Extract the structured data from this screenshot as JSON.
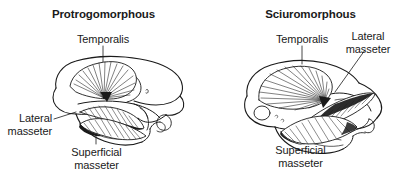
{
  "figure": {
    "type": "anatomical-illustration",
    "background_color": "#ffffff",
    "ink_color": "#1a1a1a"
  },
  "panels": [
    {
      "id": "protrogomorphous",
      "title": "Protrogomorphous",
      "labels": {
        "temporalis": "Temporalis",
        "lateral_masseter_line1": "Lateral",
        "lateral_masseter_line2": "masseter",
        "superficial_masseter_line1": "Superficial",
        "superficial_masseter_line2": "masseter"
      }
    },
    {
      "id": "sciuromorphous",
      "title": "Sciuromorphous",
      "labels": {
        "temporalis": "Temporalis",
        "lateral_masseter_line1": "Lateral",
        "lateral_masseter_line2": "masseter",
        "superficial_masseter_line1": "Superficial",
        "superficial_masseter_line2": "masseter"
      }
    }
  ]
}
